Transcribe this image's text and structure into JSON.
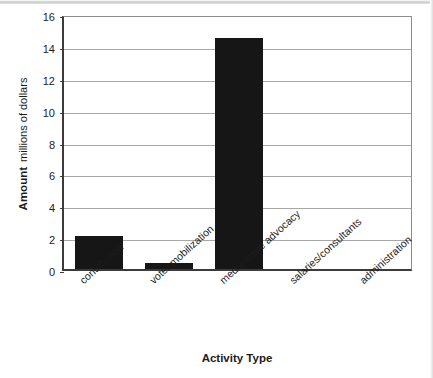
{
  "chart_data": {
    "type": "bar",
    "title": "",
    "xlabel": "Activity Type",
    "ylabel_bold": "Amount",
    "ylabel_sub": "millions of dollars",
    "categories": [
      "contribution",
      "voter mobilization",
      "media-issue advocacy",
      "salaries/consultants",
      "administration"
    ],
    "values": [
      2.05,
      0.4,
      14.5,
      0,
      0
    ],
    "ylim": [
      0,
      16
    ],
    "yticks": [
      0,
      2,
      4,
      6,
      8,
      10,
      12,
      14,
      16
    ],
    "ytick_labels": [
      "0",
      "2",
      "4",
      "6",
      "8",
      "10",
      "12",
      "14",
      "16"
    ],
    "grid": "horizontal",
    "legend": "none",
    "bar_color": "#161616",
    "gridline_color": "#a8a8a8",
    "axis_color": "#3b3b3b",
    "background": "#ffffff"
  }
}
